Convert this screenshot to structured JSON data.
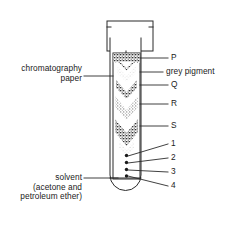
{
  "diagram": {
    "type": "labelled-science-diagram",
    "colors": {
      "ink": "#1a1a1a",
      "line": "#2b2b2b",
      "background": "#ffffff",
      "pigment_dark": "#3a3a3a",
      "pigment_mid": "#6d6d6d",
      "pigment_light": "#a8a8a8"
    }
  },
  "left_labels": [
    {
      "id": "chromatography-paper",
      "line1": "chromatography",
      "line2": "paper",
      "text": "chromatography paper"
    },
    {
      "id": "solvent",
      "line1": "solvent",
      "line2": "(acetone and",
      "line3": "petroleum ether)",
      "text": "solvent (acetone and petroleum ether)"
    }
  ],
  "right_labels": [
    {
      "id": "band-p",
      "text": "P"
    },
    {
      "id": "band-grey-pigment",
      "text": "grey pigment"
    },
    {
      "id": "band-q",
      "text": "Q"
    },
    {
      "id": "band-r",
      "text": "R"
    },
    {
      "id": "band-s",
      "text": "S"
    },
    {
      "id": "spot-1",
      "text": "1"
    },
    {
      "id": "spot-2",
      "text": "2"
    },
    {
      "id": "spot-3",
      "text": "3"
    },
    {
      "id": "spot-4",
      "text": "4"
    }
  ],
  "bands": [
    {
      "name": "P",
      "shade": "dark"
    },
    {
      "name": "grey pigment",
      "shade": "light"
    },
    {
      "name": "Q",
      "shade": "dark"
    },
    {
      "name": "R",
      "shade": "mid"
    },
    {
      "name": "S",
      "shade": "dark"
    }
  ],
  "spots": [
    {
      "name": "1"
    },
    {
      "name": "2"
    },
    {
      "name": "3"
    },
    {
      "name": "4"
    }
  ]
}
